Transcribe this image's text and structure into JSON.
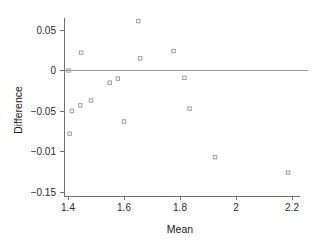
{
  "chart_data": {
    "type": "scatter",
    "title": "",
    "subtitle": "",
    "xlabel": "Mean",
    "ylabel": "Difference",
    "xlim": [
      1.36,
      2.26
    ],
    "ylim": [
      -0.158,
      0.072
    ],
    "grid": false,
    "legend": null,
    "annotations": [
      {
        "name": "zero-reference-line",
        "type": "hline",
        "y": 0.0
      }
    ],
    "xticks": [
      1.4,
      1.6,
      1.8,
      2.0,
      2.2
    ],
    "xticklabels": [
      "1.4",
      "1.6",
      "1.8",
      "2",
      "2.2"
    ],
    "yticks": [
      0.05,
      0.0,
      -0.05,
      -0.1,
      -0.15
    ],
    "yticklabels": [
      "0.05",
      "0",
      "−0.05",
      "−0.01",
      "−0.15"
    ],
    "marker_style": "open-square",
    "series": [
      {
        "name": "difference-vs-mean",
        "points": [
          {
            "x": 1.402,
            "y": 0.0
          },
          {
            "x": 1.406,
            "y": -0.078
          },
          {
            "x": 1.414,
            "y": -0.05
          },
          {
            "x": 1.444,
            "y": -0.043
          },
          {
            "x": 1.447,
            "y": 0.022
          },
          {
            "x": 1.482,
            "y": -0.037
          },
          {
            "x": 1.549,
            "y": -0.015
          },
          {
            "x": 1.578,
            "y": -0.01
          },
          {
            "x": 1.6,
            "y": -0.063
          },
          {
            "x": 1.651,
            "y": 0.061
          },
          {
            "x": 1.658,
            "y": 0.015
          },
          {
            "x": 1.777,
            "y": 0.024
          },
          {
            "x": 1.816,
            "y": -0.009
          },
          {
            "x": 1.834,
            "y": -0.047
          },
          {
            "x": 1.925,
            "y": -0.107
          },
          {
            "x": 2.186,
            "y": -0.126
          }
        ]
      }
    ]
  },
  "axis": {
    "x_title": "Mean",
    "y_title": "Difference"
  },
  "colors": {
    "marker_stroke": "#9e9e9e",
    "axis": "#6f6f6f",
    "reference_line": "#9a9a9a",
    "text": "#1a1a1a",
    "background": "#ffffff"
  }
}
